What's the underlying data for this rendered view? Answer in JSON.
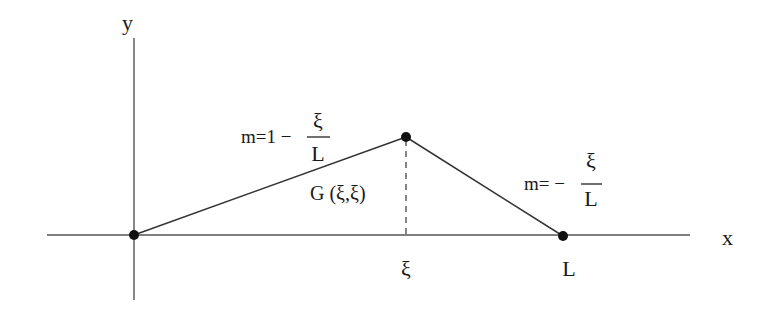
{
  "diagram": {
    "axes": {
      "x_label": "x",
      "y_label": "y"
    },
    "points": [
      {
        "name": "origin",
        "label": ""
      },
      {
        "name": "peak",
        "label": "G (ξ,ξ)"
      },
      {
        "name": "end",
        "label": "L"
      }
    ],
    "tick_labels": {
      "xi": "ξ",
      "L": "L"
    },
    "slopes": {
      "left": {
        "prefix": "m=1 −",
        "numerator": "ξ",
        "denominator": "L"
      },
      "right": {
        "prefix": "m= −",
        "numerator": "ξ",
        "denominator": "L"
      }
    },
    "peak_label": "G (ξ,ξ)"
  }
}
